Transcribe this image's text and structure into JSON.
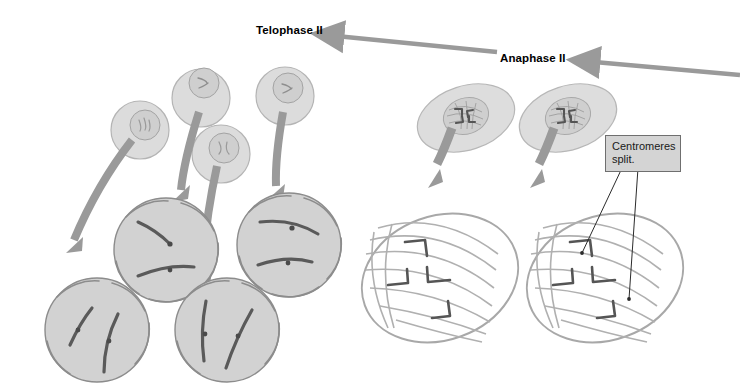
{
  "figure": {
    "title_stage_left": "Telophase II",
    "title_stage_right": "Anaphase II",
    "callout": {
      "text": "Centromeres\nsplit."
    }
  },
  "labels": {
    "telophase": "Telophase II",
    "anaphase": "Anaphase II"
  },
  "colors": {
    "cell_fill": "#d2d2d2",
    "cell_stroke": "#8c8c8c",
    "nucleus_fill": "#c8c8c8",
    "chromosome": "#595959",
    "arrow_gray": "#9a9a9a",
    "spindle": "#a8a8a8",
    "callout_fill": "#d4d4d4",
    "callout_stroke": "#6f6f6f",
    "leader_line": "#2b2b2b",
    "text": "#000000",
    "background": "#ffffff"
  },
  "diagram": {
    "type": "meiosis-stage-illustration",
    "flow_direction": "right-to-left",
    "stages": [
      {
        "name": "Anaphase II",
        "cell_count": 2,
        "cell_shape": "ellipse",
        "features": [
          "spindle fibers",
          "V-shaped chromosomes",
          "split centromeres"
        ]
      },
      {
        "name": "Telophase II",
        "cell_count": 4,
        "cell_shape": "circle",
        "features": [
          "reforming nuclear envelope",
          "decondensing chromosomes"
        ]
      }
    ],
    "daughter_nuclei": {
      "count": 4,
      "shape": "small round cell with nucleus"
    }
  },
  "icons": {
    "flow_arrow": "thick-gray-arrow-icon",
    "leader_line": "callout-leader-line-icon"
  }
}
